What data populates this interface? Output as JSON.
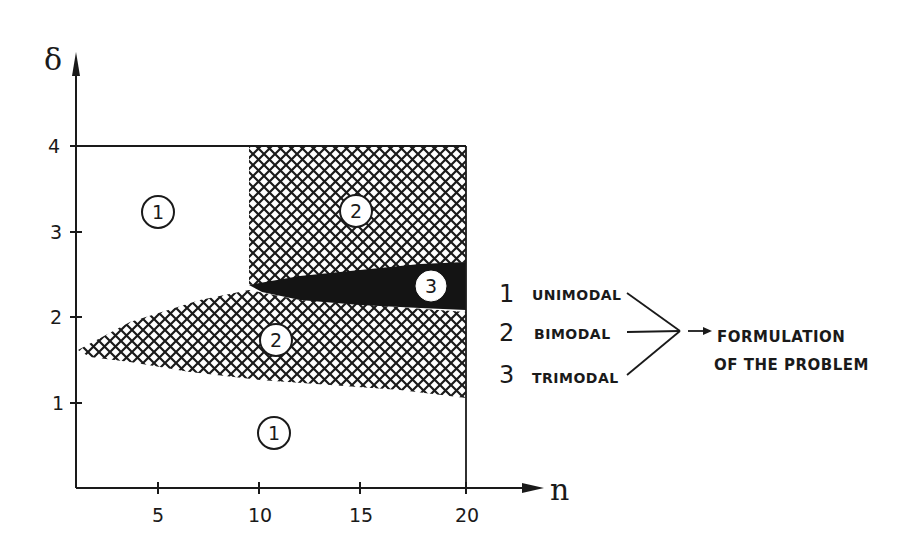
{
  "diagram": {
    "y_axis": {
      "label": "δ",
      "ticks": [
        "1",
        "2",
        "3",
        "4"
      ]
    },
    "x_axis": {
      "label": "n",
      "ticks": [
        "5",
        "10",
        "15",
        "20"
      ]
    },
    "regions": [
      {
        "id": "region-1-upper-left",
        "label": "1",
        "meaning": "unimodal",
        "fill": "white"
      },
      {
        "id": "region-2-upper-right",
        "label": "2",
        "meaning": "bimodal",
        "fill": "crosshatch"
      },
      {
        "id": "region-3-wedge",
        "label": "3",
        "meaning": "trimodal",
        "fill": "black"
      },
      {
        "id": "region-2-lower-wedge",
        "label": "2",
        "meaning": "bimodal",
        "fill": "crosshatch"
      },
      {
        "id": "region-1-bottom",
        "label": "1",
        "meaning": "unimodal",
        "fill": "white"
      }
    ],
    "legend": {
      "items": [
        {
          "num": "1",
          "text": "UNIMODAL"
        },
        {
          "num": "2",
          "text": "BIMODAL"
        },
        {
          "num": "3",
          "text": "TRIMODAL"
        }
      ],
      "result_line1": "FORMULATION",
      "result_line2": "OF THE PROBLEM"
    },
    "colors": {
      "ink": "#1a1a1a",
      "background": "#ffffff"
    }
  }
}
